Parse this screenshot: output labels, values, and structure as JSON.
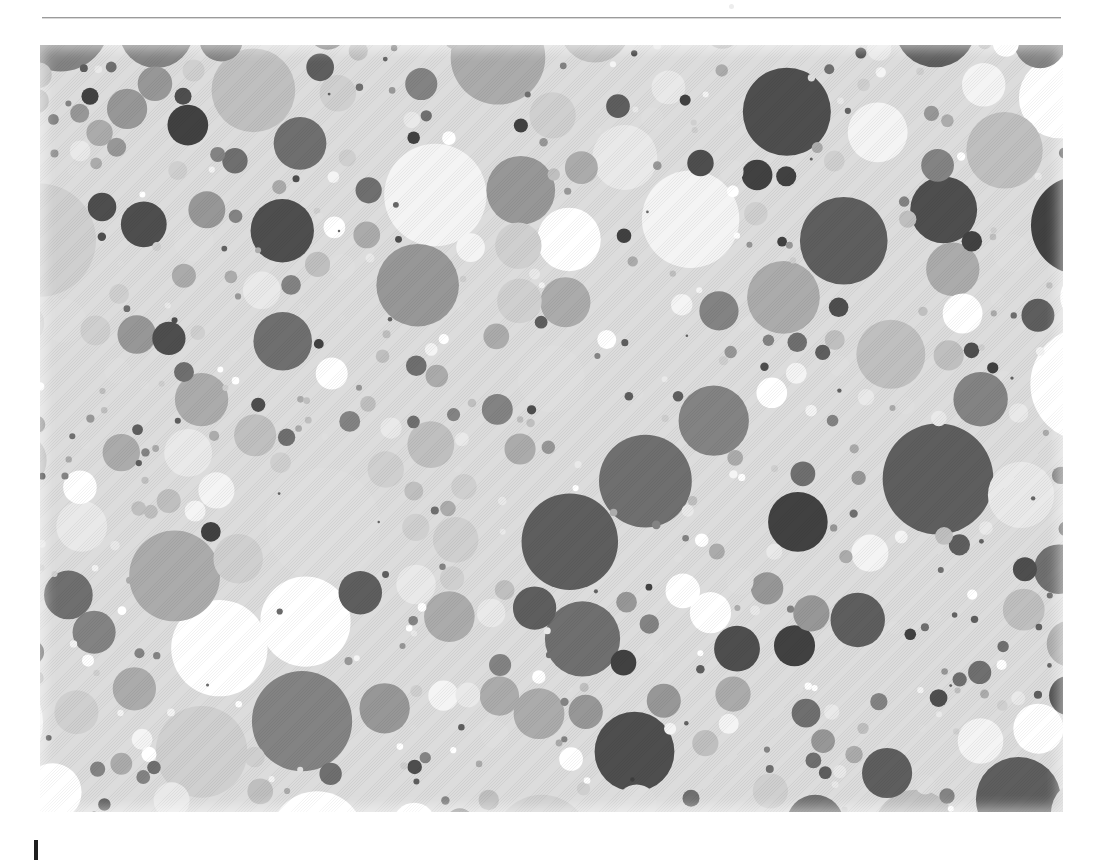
{
  "page": {
    "background": "#ffffff",
    "width": 1103,
    "height": 864
  },
  "header": {
    "rule_color": "#9b9b9b",
    "rule_label": "",
    "speck_label": ""
  },
  "caption": {
    "text": "",
    "cursor_color": "#202020"
  },
  "figure": {
    "title": "",
    "background": "#dcdcdc",
    "left": 40,
    "top": 45,
    "width": 1023,
    "height": 767
  },
  "chart_data": {
    "type": "scatter",
    "title": "",
    "subtitle": "",
    "xlabel": "",
    "ylabel": "",
    "xlim": [
      0,
      1023
    ],
    "ylim": [
      0,
      767
    ],
    "grid": false,
    "legend": null,
    "annotations": [],
    "tick_labels_x": [],
    "tick_labels_y": [],
    "marker": "circle",
    "background": "#dcdcdc",
    "palette": [
      "#ffffff",
      "#f4f4f4",
      "#e9e9e9",
      "#dedede",
      "#cfcfcf",
      "#bfbfbf",
      "#ababab",
      "#979797",
      "#838383",
      "#6f6f6f",
      "#5e5e5e",
      "#4e4e4e",
      "#414141"
    ],
    "palette_weights": [
      9,
      6,
      10,
      9,
      11,
      9,
      9,
      8,
      7,
      7,
      6,
      5,
      4
    ],
    "radius_distribution": {
      "min": 3,
      "max": 58,
      "mode": "power",
      "exponent": 2.1
    },
    "circle_count": 520,
    "seed": 20240517,
    "series": [
      {
        "name": "circles",
        "count": 520
      }
    ]
  }
}
